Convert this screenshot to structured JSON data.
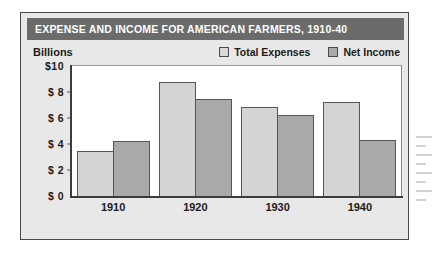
{
  "figure": {
    "title": "EXPENSE AND INCOME FOR AMERICAN FARMERS, 1910-40",
    "units_label": "Billions"
  },
  "colors": {
    "title_banner": "#6b6b6b",
    "panel_background": "#e8e8e8",
    "plot_background": "#ffffff",
    "total_expenses": "#d4d4d4",
    "net_income": "#a9a9a9",
    "bar_outline": "#555555",
    "axis": "#3c3c3c"
  },
  "legend": {
    "items": [
      {
        "label": "Total Expenses",
        "swatch": "light"
      },
      {
        "label": "Net Income",
        "swatch": "dark"
      }
    ]
  },
  "chart_data": {
    "type": "bar",
    "title": "EXPENSE AND INCOME FOR AMERICAN FARMERS, 1910-40",
    "xlabel": "",
    "ylabel": "Billions",
    "categories": [
      "1910",
      "1920",
      "1930",
      "1940"
    ],
    "series": [
      {
        "name": "Total Expenses",
        "values": [
          3.5,
          8.75,
          6.85,
          7.2
        ]
      },
      {
        "name": "Net Income",
        "values": [
          4.2,
          7.5,
          6.25,
          4.3
        ]
      }
    ],
    "ylim": [
      0,
      10
    ],
    "ytick_values": [
      10,
      8,
      6,
      4,
      2,
      0
    ],
    "ytick_labels": [
      "$10",
      "$ 8",
      "$ 6",
      "$ 4",
      "$ 2",
      "$ 0"
    ],
    "grid": false,
    "legend_position": "top-right"
  }
}
